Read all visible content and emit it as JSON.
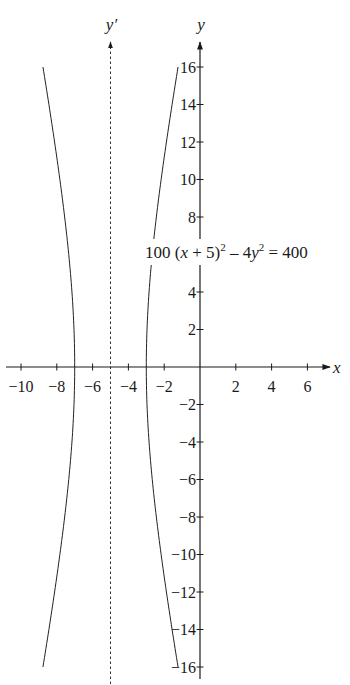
{
  "chart_data": {
    "type": "line",
    "title": "",
    "equation": "100 (x + 5)^2 - 4y^2 = 400",
    "equation_parts": {
      "lead": "100 (",
      "x": "x",
      "mid": " + 5)",
      "sup1": "2",
      "minus": " – 4",
      "y": "y",
      "sup2": "2",
      "tail": " = 400"
    },
    "xlabel": "x",
    "ylabel": "y",
    "asymptote_label": "y′",
    "xlim": [
      -11,
      7.5
    ],
    "ylim": [
      -16.5,
      17
    ],
    "x_ticks": [
      -10,
      -8,
      -6,
      -4,
      -2,
      2,
      4,
      6
    ],
    "x_tick_labels": [
      "−10",
      "−8",
      "−6",
      "−4",
      "−2",
      "2",
      "4",
      "6"
    ],
    "y_ticks": [
      16,
      14,
      12,
      10,
      8,
      4,
      2,
      -2,
      -4,
      -6,
      -8,
      -10,
      -12,
      -14,
      -16
    ],
    "y_tick_labels": [
      "16",
      "14",
      "12",
      "10",
      "8",
      "4",
      "2",
      "−2",
      "−4",
      "−6",
      "−8",
      "−10",
      "−12",
      "−14",
      "−16"
    ],
    "grid": false,
    "legend": null,
    "shifted_axis": {
      "x": -5,
      "style": "dashed",
      "label": "y′"
    },
    "series": [
      {
        "name": "left branch",
        "description": "x = -5 - 2*sqrt(1 + y^2/100)",
        "vertex": [
          -7,
          0
        ],
        "y_range": [
          -16,
          16
        ],
        "points": [
          [
            -8.77,
            16
          ],
          [
            -8.23,
            12
          ],
          [
            -7.74,
            8
          ],
          [
            -7.31,
            4
          ],
          [
            -7,
            0
          ],
          [
            -7.31,
            -4
          ],
          [
            -7.74,
            -8
          ],
          [
            -8.23,
            -12
          ],
          [
            -8.77,
            -16
          ]
        ]
      },
      {
        "name": "right branch",
        "description": "x = -5 + 2*sqrt(1 + y^2/100)",
        "vertex": [
          -3,
          0
        ],
        "y_range": [
          -16,
          16
        ],
        "points": [
          [
            -1.23,
            16
          ],
          [
            -1.77,
            12
          ],
          [
            -2.26,
            8
          ],
          [
            -2.69,
            4
          ],
          [
            -3,
            0
          ],
          [
            -2.69,
            -4
          ],
          [
            -2.26,
            -8
          ],
          [
            -1.77,
            -12
          ],
          [
            -1.23,
            -16
          ]
        ]
      }
    ]
  }
}
